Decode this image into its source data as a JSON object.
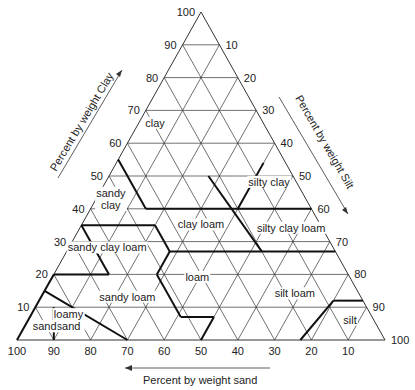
{
  "diagram": {
    "geometry": {
      "left": [
        17,
        340
      ],
      "right": [
        385,
        340
      ],
      "apex": [
        201,
        12
      ]
    },
    "colors": {
      "line": "#333333",
      "bold": "#111111",
      "text": "#222222"
    },
    "axes": {
      "clay": {
        "title": "Percent by weight Clay",
        "ticks": [
          "10",
          "20",
          "30",
          "40",
          "50",
          "60",
          "70",
          "80",
          "90",
          "100"
        ]
      },
      "silt": {
        "title": "Percent by weight Silt",
        "ticks": [
          "10",
          "20",
          "30",
          "40",
          "50",
          "60",
          "70",
          "80",
          "90",
          "100"
        ]
      },
      "sand": {
        "title": "Percent by weight sand",
        "ticks": [
          "100",
          "90",
          "80",
          "70",
          "60",
          "50",
          "40",
          "30",
          "20",
          "10"
        ]
      }
    },
    "regions": [
      {
        "name": "clay",
        "label": "clay",
        "pos": [
          30,
          65
        ]
      },
      {
        "name": "sandy-clay",
        "label": "sandy",
        "label2": "clay",
        "pos": [
          53,
          43
        ]
      },
      {
        "name": "silty-clay",
        "label": "silty clay",
        "pos": [
          8,
          47
        ]
      },
      {
        "name": "clay-loam",
        "label": "clay loam",
        "pos": [
          33,
          34
        ]
      },
      {
        "name": "silty-clay-loam",
        "label": "silty clay loam",
        "pos": [
          9,
          33
        ]
      },
      {
        "name": "sandy-clay-loam",
        "label": "sandy clay loam",
        "pos": [
          62,
          27
        ]
      },
      {
        "name": "loam",
        "label": "loam",
        "pos": [
          42,
          18
        ]
      },
      {
        "name": "sandy-loam",
        "label": "sandy loam",
        "pos": [
          64,
          12
        ]
      },
      {
        "name": "silt-loam",
        "label": "silt loam",
        "pos": [
          18,
          13
        ]
      },
      {
        "name": "silt",
        "label": "silt",
        "pos": [
          7,
          5
        ]
      },
      {
        "name": "loamy-sand",
        "label": "loamy",
        "label2": "sand",
        "pos": [
          83,
          6
        ]
      },
      {
        "name": "sand",
        "label": "sand",
        "pos": [
          91,
          3
        ]
      }
    ],
    "boundaries": [
      [
        [
          45,
          55
        ],
        [
          45,
          40
        ]
      ],
      [
        [
          65,
          35
        ],
        [
          45,
          35
        ]
      ],
      [
        [
          45,
          40
        ],
        [
          0,
          40
        ]
      ],
      [
        [
          65,
          35
        ],
        [
          65,
          20
        ]
      ],
      [
        [
          45,
          35
        ],
        [
          45,
          27
        ]
      ],
      [
        [
          45,
          27
        ],
        [
          20,
          27
        ]
      ],
      [
        [
          20,
          27
        ],
        [
          0,
          27
        ]
      ],
      [
        [
          65,
          20
        ],
        [
          80,
          20
        ]
      ],
      [
        [
          45,
          27
        ],
        [
          52,
          20
        ]
      ],
      [
        [
          52,
          20
        ],
        [
          52,
          7
        ]
      ],
      [
        [
          52,
          7
        ],
        [
          43,
          7
        ]
      ],
      [
        [
          43,
          7
        ],
        [
          50,
          0
        ]
      ],
      [
        [
          20,
          40
        ],
        [
          6,
          54
        ]
      ],
      [
        [
          20,
          27
        ],
        [
          23,
          50
        ]
      ],
      [
        [
          23,
          0
        ],
        [
          8,
          12
        ]
      ],
      [
        [
          8,
          12
        ],
        [
          0,
          12
        ]
      ],
      [
        [
          80,
          20
        ],
        [
          85,
          15
        ]
      ],
      [
        [
          85,
          15
        ],
        [
          70,
          0
        ]
      ],
      [
        [
          85,
          10
        ],
        [
          90,
          0
        ]
      ],
      [
        [
          100,
          0
        ],
        [
          85,
          15
        ]
      ]
    ]
  }
}
